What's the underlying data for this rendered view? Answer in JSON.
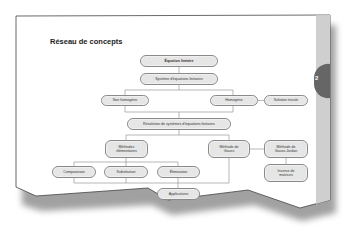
{
  "page": {
    "title": "Réseau de concepts",
    "chapter_tab": "2",
    "colors": {
      "paper": "#ffffff",
      "node_fill": "#e6e6e6",
      "node_border": "#8a8a8a",
      "side_band": "#c8c8c8",
      "tab": "#666666",
      "line": "#888888"
    }
  },
  "concept_map": {
    "nodes": {
      "equation_lineaire": "Équation linéaire",
      "systeme": "Système d'équations linéaires",
      "non_homogene": "Non homogène",
      "homogene": "Homogène",
      "solution_triviale": "Solution triviale",
      "resolution": "Résolution de systèmes d'équations linéaires",
      "methodes_elementaires": "Méthodes élémentaires",
      "methode_gauss": "Méthode de Gauss",
      "methode_gauss_jordan": "Méthode de Gauss-Jordan",
      "inverse_matrices": "Inverse de matrices",
      "comparaison": "Comparaison",
      "substitution": "Substitution",
      "elimination": "Élimination",
      "applications": "Applications"
    }
  }
}
